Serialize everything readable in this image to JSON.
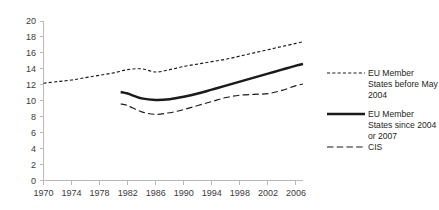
{
  "chart_data": {
    "type": "line",
    "title": "",
    "subtitle": "",
    "xlabel": "",
    "ylabel": "",
    "xlim": [
      1970,
      2007
    ],
    "ylim": [
      0,
      20
    ],
    "grid": false,
    "legend_position": "right",
    "x_ticks": [
      "1970",
      "1974",
      "1978",
      "1982",
      "1986",
      "1990",
      "1994",
      "1998",
      "2002",
      "2006"
    ],
    "x_tick_values": [
      1970,
      1974,
      1978,
      1982,
      1986,
      1990,
      1994,
      1998,
      2002,
      2006
    ],
    "y_ticks": [
      "0",
      "2",
      "4",
      "6",
      "8",
      "10",
      "12",
      "14",
      "16",
      "18",
      "20"
    ],
    "y_tick_values": [
      0,
      2,
      4,
      6,
      8,
      10,
      12,
      14,
      16,
      18,
      20
    ],
    "series": [
      {
        "name": "EU Member States before May 2004",
        "style": "dotted",
        "color": "#1a1a1a",
        "x": [
          1970,
          1972,
          1974,
          1976,
          1978,
          1980,
          1982,
          1984,
          1986,
          1988,
          1990,
          1992,
          1994,
          1996,
          1998,
          2000,
          2002,
          2004,
          2006,
          2007
        ],
        "values": [
          12.2,
          12.4,
          12.6,
          12.9,
          13.2,
          13.5,
          13.9,
          14.0,
          13.6,
          13.9,
          14.3,
          14.6,
          14.9,
          15.2,
          15.6,
          16.0,
          16.4,
          16.8,
          17.2,
          17.4
        ]
      },
      {
        "name": "EU Member States since 2004 or 2007",
        "style": "solid",
        "color": "#1a1a1a",
        "x": [
          1981,
          1982,
          1984,
          1986,
          1988,
          1990,
          1992,
          1994,
          1996,
          1998,
          2000,
          2002,
          2004,
          2006,
          2007
        ],
        "values": [
          11.1,
          10.9,
          10.3,
          10.1,
          10.2,
          10.5,
          10.9,
          11.4,
          11.9,
          12.4,
          12.9,
          13.4,
          13.9,
          14.4,
          14.6
        ]
      },
      {
        "name": "CIS",
        "style": "dashed",
        "color": "#1a1a1a",
        "x": [
          1981,
          1982,
          1984,
          1986,
          1988,
          1990,
          1992,
          1994,
          1996,
          1998,
          2000,
          2002,
          2004,
          2006,
          2007
        ],
        "values": [
          9.6,
          9.4,
          8.6,
          8.3,
          8.5,
          8.9,
          9.4,
          9.9,
          10.4,
          10.7,
          10.8,
          10.9,
          11.3,
          11.9,
          12.1
        ]
      }
    ],
    "legend": [
      {
        "label_line1": "EU Member",
        "label_line2": "States before May",
        "label_line3": "2004",
        "style": "dotted"
      },
      {
        "label_line1": "EU Member",
        "label_line2": "States since 2004",
        "label_line3": "or 2007",
        "style": "solid"
      },
      {
        "label_line1": "CIS",
        "label_line2": "",
        "label_line3": "",
        "style": "dashed"
      }
    ]
  }
}
